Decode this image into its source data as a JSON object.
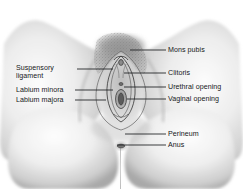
{
  "figure": {
    "type": "anatomical-illustration",
    "style": "grayscale pencil/airbrush medical illustration on white background",
    "palette": {
      "background": "#ffffff",
      "skin_light": "#f2f2f2",
      "skin_mid": "#d8d8d8",
      "skin_shadow": "#9a9a9a",
      "deep_shadow": "#6e6e6e",
      "hair_stipple": "#6a6a6a",
      "label_text": "#16181a",
      "leader_line": "#1b1d20"
    }
  },
  "labels": {
    "left": [
      {
        "id": "suspensory-ligament",
        "line1": "Suspensory",
        "line2": "ligament"
      },
      {
        "id": "labium-minora",
        "text": "Labium minora"
      },
      {
        "id": "labium-majora",
        "text": "Labium majora"
      }
    ],
    "right": [
      {
        "id": "mons-pubis",
        "text": "Mons pubis"
      },
      {
        "id": "clitoris",
        "text": "Clitoris"
      },
      {
        "id": "urethral-opening",
        "text": "Urethral opening"
      },
      {
        "id": "vaginal-opening",
        "text": "Vaginal opening"
      },
      {
        "id": "perineum",
        "text": "Perineum"
      },
      {
        "id": "anus",
        "text": "Anus"
      }
    ]
  }
}
